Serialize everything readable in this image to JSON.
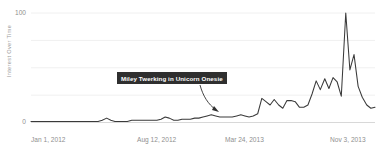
{
  "chart_data": {
    "type": "line",
    "title": "",
    "xlabel": "",
    "ylabel": "Interest Over Time",
    "ylim": [
      0,
      100
    ],
    "yticks": [
      0,
      100
    ],
    "ytick_labels": [
      "0",
      "100"
    ],
    "grid": true,
    "gridlines_y": [
      0,
      25,
      50,
      75,
      100
    ],
    "legend": "none",
    "x_tick_labels": [
      "Jan 1, 2012",
      "Aug 12, 2012",
      "Mar 24, 2013",
      "Nov 3, 2013"
    ],
    "x_tick_positions_px": [
      38,
      160,
      248,
      352
    ],
    "annotations": [
      {
        "text": "Miley Twerking in Unicorn Onesie",
        "box_x_px": 117,
        "box_y_px": 72,
        "arrow_from_px": [
          200,
          84
        ],
        "arrow_to_px": [
          219,
          112
        ]
      }
    ],
    "line_color": "#3a3a3a",
    "grid_color": "#f0f0f0",
    "axis_text_color": "#8f8f8f",
    "series": [
      {
        "name": "Interest Over Time",
        "x": [
          0.0,
          1.2,
          2.4,
          3.6,
          4.9,
          6.1,
          7.3,
          8.5,
          9.8,
          11.0,
          12.2,
          13.4,
          14.6,
          15.9,
          17.1,
          18.3,
          19.5,
          20.7,
          22.0,
          23.2,
          24.4,
          25.6,
          26.8,
          28.0,
          29.3,
          30.5,
          31.7,
          32.9,
          34.1,
          35.4,
          36.6,
          37.8,
          39.0,
          40.2,
          41.5,
          42.7,
          43.9,
          45.1,
          46.3,
          47.6,
          48.8,
          50.0,
          51.2,
          52.4,
          53.7,
          54.9,
          56.1,
          57.3,
          58.5,
          59.8,
          61.0,
          62.2,
          63.4,
          64.6,
          65.9,
          67.1,
          68.3,
          69.5,
          70.7,
          72.0,
          73.2,
          74.4,
          75.6,
          76.8,
          78.0,
          79.3,
          80.5,
          81.7,
          82.9,
          84.1,
          85.4,
          86.6,
          87.8,
          89.0,
          90.2,
          91.5,
          92.7,
          93.9,
          95.1,
          96.3,
          97.6,
          98.8,
          100.0
        ],
        "values": [
          1,
          1,
          1,
          1,
          1,
          1,
          1,
          1,
          1,
          1,
          1,
          1,
          1,
          1,
          1,
          1,
          1,
          2,
          4,
          2,
          1,
          1,
          1,
          1,
          2,
          2,
          2,
          2,
          2,
          2,
          2,
          3,
          5,
          4,
          2,
          2,
          3,
          3,
          3,
          4,
          4,
          5,
          6,
          7,
          6,
          5,
          5,
          5,
          5,
          6,
          7,
          6,
          5,
          6,
          8,
          22,
          19,
          16,
          21,
          16,
          13,
          20,
          20,
          19,
          14,
          14,
          16,
          26,
          38,
          30,
          40,
          31,
          41,
          37,
          24,
          100,
          48,
          62,
          33,
          23,
          16,
          13,
          14
        ]
      }
    ]
  },
  "axis": {
    "y_label": "Interest Over Time",
    "y_top_tick": "100",
    "y_bottom_tick": "0",
    "x_labels": {
      "t0": "Jan 1, 2012",
      "t1": "Aug 12, 2012",
      "t2": "Mar 24, 2013",
      "t3": "Nov 3, 2013"
    }
  },
  "annotation": {
    "label": "Miley Twerking in Unicorn Onesie"
  }
}
